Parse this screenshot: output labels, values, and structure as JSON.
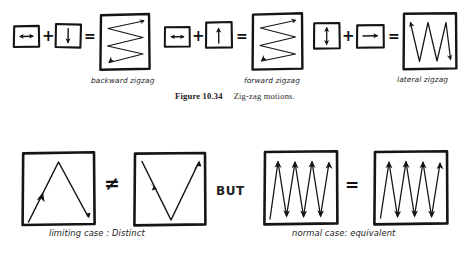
{
  "figure": {
    "caption_label": "Figure 10.34",
    "caption_text": "Zig-zag motions.",
    "ink_color": "#151515",
    "page_color": "#ffffff"
  },
  "top_row": {
    "equations": [
      {
        "id": "backward-zigzag",
        "label": "backward zigzag",
        "operator_plus": "+",
        "operator_equals": "=",
        "operand_1_icon": "horizontal-double-arrow-icon",
        "operand_2_icon": "down-arrow-icon",
        "result_icon": "backward-zigzag-icon"
      },
      {
        "id": "forward-zigzag",
        "label": "forward zigzag",
        "operator_plus": "+",
        "operator_equals": "=",
        "operand_1_icon": "horizontal-double-arrow-icon",
        "operand_2_icon": "up-arrow-icon",
        "result_icon": "forward-zigzag-icon"
      },
      {
        "id": "lateral-zigzag",
        "label": "lateral zigzag",
        "operator_plus": "+",
        "operator_equals": "=",
        "operand_1_icon": "vertical-double-arrow-icon",
        "operand_2_icon": "right-arrow-icon",
        "result_icon": "lateral-zigzag-icon"
      }
    ]
  },
  "bottom_row": {
    "left_group": {
      "label": "limiting case : Distinct",
      "relation": "≠",
      "panel_1_icon": "peak-path-icon",
      "panel_2_icon": "valley-path-icon"
    },
    "connector": "BUT",
    "right_group": {
      "label": "normal case: equivalent",
      "relation": "=",
      "panel_1_icon": "dense-zigzag-icon",
      "panel_2_icon": "dense-zigzag-icon"
    }
  }
}
